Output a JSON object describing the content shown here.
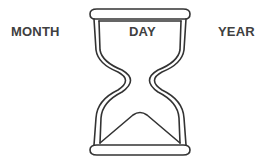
{
  "labels": {
    "month": "MONTH",
    "day": "DAY",
    "year": "YEAR"
  },
  "illustration": {
    "icon": "hourglass-icon",
    "stroke_color": "#333333",
    "background": "#ffffff"
  }
}
